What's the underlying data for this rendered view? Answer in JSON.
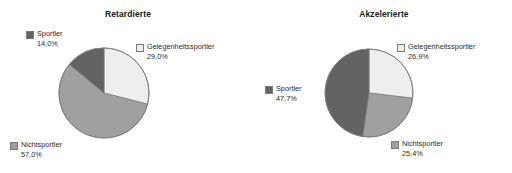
{
  "page": {
    "background": "#ffffff",
    "palette": {
      "gelegenheitssportler": "#eeeeee",
      "nichtsportler": "#a0a0a0",
      "sportler": "#636363",
      "outline": "#7a7a7a",
      "text": "#2b2b2b",
      "title": "#1a1a1a"
    }
  },
  "charts": [
    {
      "id": "retardierte",
      "title": "Retardierte",
      "center": {
        "x": 104,
        "y": 93
      },
      "radius": 45,
      "legends": [
        {
          "key": "sportler",
          "label": "Sportler",
          "pct": "14,0%",
          "color": "#636363",
          "x": 26,
          "y": 29,
          "swatch": true
        },
        {
          "key": "gelegenheitssportler",
          "label": "Gelegenheitssportler",
          "pct": "29,0%",
          "color": "#eeeeee",
          "x": 136,
          "y": 42,
          "swatch": true
        },
        {
          "key": "nichtsportler",
          "label": "Nichtsportler",
          "pct": "57,0%",
          "color": "#a0a0a0",
          "x": 10,
          "y": 140,
          "swatch": true
        }
      ]
    },
    {
      "id": "akzelerierte",
      "title": "Akzelerierte",
      "center": {
        "x": 113,
        "y": 93
      },
      "radius": 44,
      "legends": [
        {
          "key": "gelegenheitssportler",
          "label": "Gelegenheitssportler",
          "pct": "26,9%",
          "color": "#eeeeee",
          "x": 141,
          "y": 42,
          "swatch": true
        },
        {
          "key": "sportler",
          "label": "Sportler",
          "pct": "47,7%",
          "color": "#636363",
          "x": 9,
          "y": 84,
          "swatch": true
        },
        {
          "key": "nichtsportler",
          "label": "Nichtsportler",
          "pct": "25,4%",
          "color": "#a0a0a0",
          "x": 135,
          "y": 139,
          "swatch": true
        }
      ]
    }
  ],
  "chart_data": [
    {
      "type": "pie",
      "title": "Retardierte",
      "labels": [
        "Gelegenheitssportler",
        "Nichtsportler",
        "Sportler"
      ],
      "values": [
        29.0,
        57.0,
        14.0
      ],
      "value_labels": [
        "29,0%",
        "57,0%",
        "14,0%"
      ],
      "colors": [
        "#eeeeee",
        "#a0a0a0",
        "#636363"
      ],
      "units": "percent",
      "start_angle_deg": 0,
      "direction": "clockwise",
      "legend_position": "around-pie",
      "grid": false
    },
    {
      "type": "pie",
      "title": "Akzelerierte",
      "labels": [
        "Gelegenheitssportler",
        "Nichtsportler",
        "Sportler"
      ],
      "values": [
        26.9,
        25.4,
        47.7
      ],
      "value_labels": [
        "26,9%",
        "25,4%",
        "47,7%"
      ],
      "colors": [
        "#eeeeee",
        "#a0a0a0",
        "#636363"
      ],
      "units": "percent",
      "start_angle_deg": 0,
      "direction": "clockwise",
      "legend_position": "around-pie",
      "grid": false
    }
  ]
}
